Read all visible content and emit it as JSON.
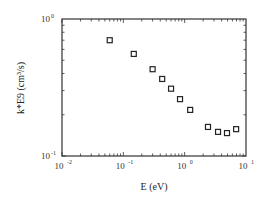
{
  "chart_data": {
    "type": "scatter",
    "title": "",
    "xlabel": "E (eV)",
    "ylabel": "k*E9 (cm³/s)",
    "xscale": "log",
    "yscale": "log",
    "xlim": [
      0.01,
      10
    ],
    "ylim": [
      0.1,
      1
    ],
    "x_ticks": [
      {
        "base": "10",
        "exp": "-2",
        "value": 0.01
      },
      {
        "base": "10",
        "exp": "-1",
        "value": 0.1
      },
      {
        "base": "10",
        "exp": "0",
        "value": 1
      },
      {
        "base": "10",
        "exp": "1",
        "value": 10
      }
    ],
    "y_ticks": [
      {
        "base": "10",
        "exp": "-1",
        "value": 0.1
      },
      {
        "base": "10",
        "exp": "0",
        "value": 1
      }
    ],
    "grid": false,
    "legend": null,
    "marker": "open-square",
    "series": [
      {
        "name": "k*E9",
        "x": [
          0.06,
          0.148,
          0.3,
          0.43,
          0.6,
          0.84,
          1.23,
          2.4,
          3.5,
          4.9,
          6.9
        ],
        "y": [
          0.7,
          0.556,
          0.43,
          0.365,
          0.31,
          0.26,
          0.217,
          0.163,
          0.15,
          0.147,
          0.157
        ]
      }
    ]
  },
  "plot": {
    "left": 62,
    "top": 19,
    "right": 246,
    "bottom": 156,
    "axis_color": "#333333",
    "marker_color": "#222222"
  }
}
